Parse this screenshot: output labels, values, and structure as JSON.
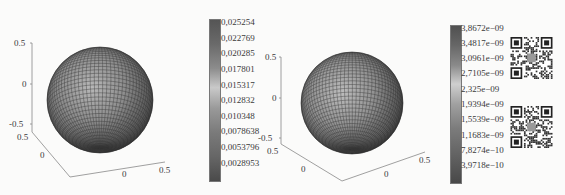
{
  "chart_data": [
    {
      "type": "surface",
      "title": "",
      "description": "3D sphere surface (radius 0.5) with meshed grid, colored by scalar field",
      "axes": {
        "z_ticks": [
          "0.5",
          "0",
          "-0.5"
        ],
        "y_ticks": [
          "0.5",
          "0"
        ],
        "x_ticks": [
          "0",
          "0.5"
        ]
      },
      "colorbar": {
        "ticks": [
          "0.025254",
          "0.022769",
          "0.020285",
          "0.017801",
          "0.015317",
          "0.012832",
          "0.010348",
          "0.0078638",
          "0.0053796",
          "0.0028953"
        ],
        "range": [
          0.0028953,
          0.025254
        ]
      }
    },
    {
      "type": "surface",
      "title": "",
      "description": "3D sphere surface (radius 0.5) with meshed grid, colored by scalar field",
      "axes": {
        "z_ticks": [
          "0.5",
          "0",
          "-0.5"
        ],
        "y_ticks": [
          "0.5",
          "0"
        ],
        "x_ticks": [
          "0",
          "0.5"
        ]
      },
      "colorbar": {
        "ticks": [
          "3.8672e-09",
          "3.4817e-09",
          "3.0961e-09",
          "2.7105e-09",
          "2.325e-09",
          "1.9394e-09",
          "1.5539e-09",
          "1.1683e-09",
          "7.8274e-10",
          "3.9718e-10"
        ],
        "range": [
          3.9718e-10,
          3.8672e-09
        ]
      }
    }
  ],
  "plot1": {
    "z_ticks": [
      "0.5",
      "0",
      "-0.5"
    ],
    "y_ticks": [
      "0.5",
      "0"
    ],
    "x_ticks": [
      "0",
      "0.5"
    ],
    "colorbar_ticks": [
      "0,025254",
      "0,022769",
      "0,020285",
      "0,017801",
      "0,015317",
      "0,012832",
      "0,010348",
      "0,0078638",
      "0,0053796",
      "0,0028953"
    ]
  },
  "plot2": {
    "z_ticks": [
      "0.5",
      "0",
      "-0.5"
    ],
    "y_ticks": [
      "0.5",
      "0"
    ],
    "x_ticks": [
      "0",
      "0.5"
    ],
    "colorbar_ticks": [
      "3,8672e−09",
      "3,4817e−09",
      "3,0961e−09",
      "2,7105e−09",
      "2,325e−09",
      "1,9394e−09",
      "1,5539e−09",
      "1,1683e−09",
      "7,8274e−10",
      "3,9718e−10"
    ]
  },
  "qr_codes": [
    {
      "name": "qr-code-1"
    },
    {
      "name": "qr-code-2"
    }
  ]
}
